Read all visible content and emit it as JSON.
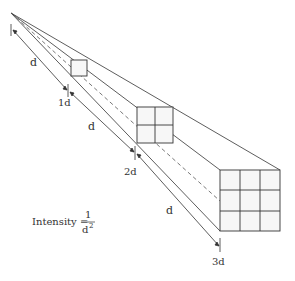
{
  "diagram": {
    "labels": {
      "d1": "d",
      "tick1": "1d",
      "d2": "d",
      "tick2": "2d",
      "d3": "d",
      "tick3": "3d"
    },
    "formula": {
      "lhs": "Intensity =",
      "numerator": "1",
      "denominator": "d",
      "exponent": "2"
    },
    "squares": [
      {
        "name": "1d",
        "grid": 1
      },
      {
        "name": "2d",
        "grid": 2
      },
      {
        "name": "3d",
        "grid": 3
      }
    ],
    "colors": {
      "line": "#333333",
      "fill": "#f7f7f7"
    }
  }
}
